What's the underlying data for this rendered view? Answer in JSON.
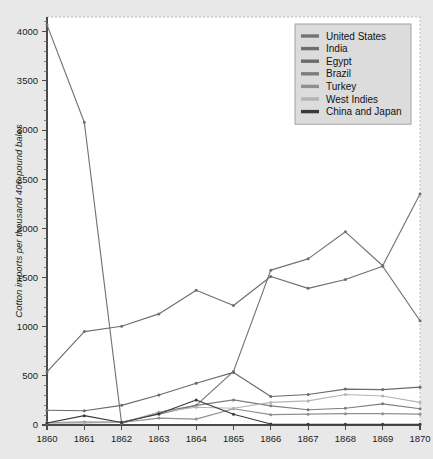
{
  "chart_data": {
    "type": "line",
    "title": "",
    "xlabel": "",
    "ylabel": "Cotton imports per thousand 400-pound bales",
    "x": [
      1860,
      1861,
      1862,
      1863,
      1864,
      1865,
      1866,
      1867,
      1868,
      1869,
      1870
    ],
    "xtick_labels": [
      "1860",
      "1861",
      "1862",
      "1863",
      "1864",
      "1865",
      "1866",
      "1867",
      "1868",
      "1869",
      "1870"
    ],
    "ytick_labels": [
      "0",
      "500",
      "1000",
      "1500",
      "2000",
      "2500",
      "3000",
      "3500",
      "4000"
    ],
    "ytick_values": [
      0,
      500,
      1000,
      1500,
      2000,
      2500,
      3000,
      3500,
      4000
    ],
    "yminor_step": 100,
    "xlim": [
      1860,
      1870
    ],
    "ylim": [
      0,
      4150
    ],
    "grid": false,
    "legend_position": "top-right",
    "series": [
      {
        "name": "United States",
        "color": "#737373",
        "values": [
          4070,
          3080,
          15,
          130,
          200,
          545,
          1575,
          1690,
          1965,
          1620,
          2350
        ]
      },
      {
        "name": "India",
        "color": "#6e6e6e",
        "values": [
          540,
          950,
          1005,
          1130,
          1370,
          1215,
          1510,
          1390,
          1480,
          1615,
          1060
        ]
      },
      {
        "name": "Egypt",
        "color": "#6b6b6b",
        "values": [
          150,
          145,
          200,
          305,
          425,
          535,
          290,
          310,
          365,
          360,
          385
        ]
      },
      {
        "name": "Brazil",
        "color": "#7d7d7d",
        "values": [
          25,
          30,
          30,
          110,
          200,
          255,
          195,
          155,
          170,
          215,
          165
        ]
      },
      {
        "name": "Turkey",
        "color": "#8f8f8f",
        "values": [
          20,
          25,
          25,
          70,
          60,
          165,
          105,
          110,
          115,
          115,
          110
        ]
      },
      {
        "name": "West Indies",
        "color": "#b4b4b4",
        "values": [
          20,
          20,
          25,
          130,
          180,
          170,
          230,
          245,
          310,
          295,
          230
        ]
      },
      {
        "name": "China and Japan",
        "color": "#3a3a3a",
        "values": [
          20,
          95,
          25,
          115,
          255,
          110,
          10,
          8,
          8,
          8,
          8
        ]
      }
    ]
  }
}
